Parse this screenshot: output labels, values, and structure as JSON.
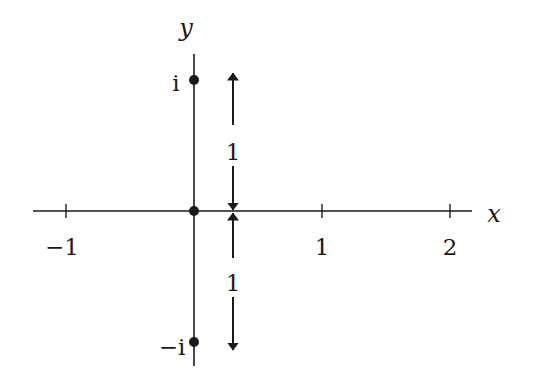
{
  "diagram": {
    "type": "complex-plane-axes",
    "axes": {
      "x_label": "x",
      "y_label": "y"
    },
    "x_ticks": [
      {
        "value": -1,
        "label": "−1"
      },
      {
        "value": 1,
        "label": "1"
      },
      {
        "value": 2,
        "label": "2"
      }
    ],
    "points": [
      {
        "name": "i",
        "label": "i",
        "x": 0,
        "y": 1
      },
      {
        "name": "origin",
        "label": "",
        "x": 0,
        "y": 0
      },
      {
        "name": "minus-i",
        "label": "−i",
        "x": 0,
        "y": -1
      }
    ],
    "distance_markers": [
      {
        "from": "origin",
        "to": "i",
        "label": "1"
      },
      {
        "from": "origin",
        "to": "minus-i",
        "label": "1"
      }
    ],
    "colors": {
      "ink": "#1a1a1a",
      "background": "#ffffff"
    }
  }
}
